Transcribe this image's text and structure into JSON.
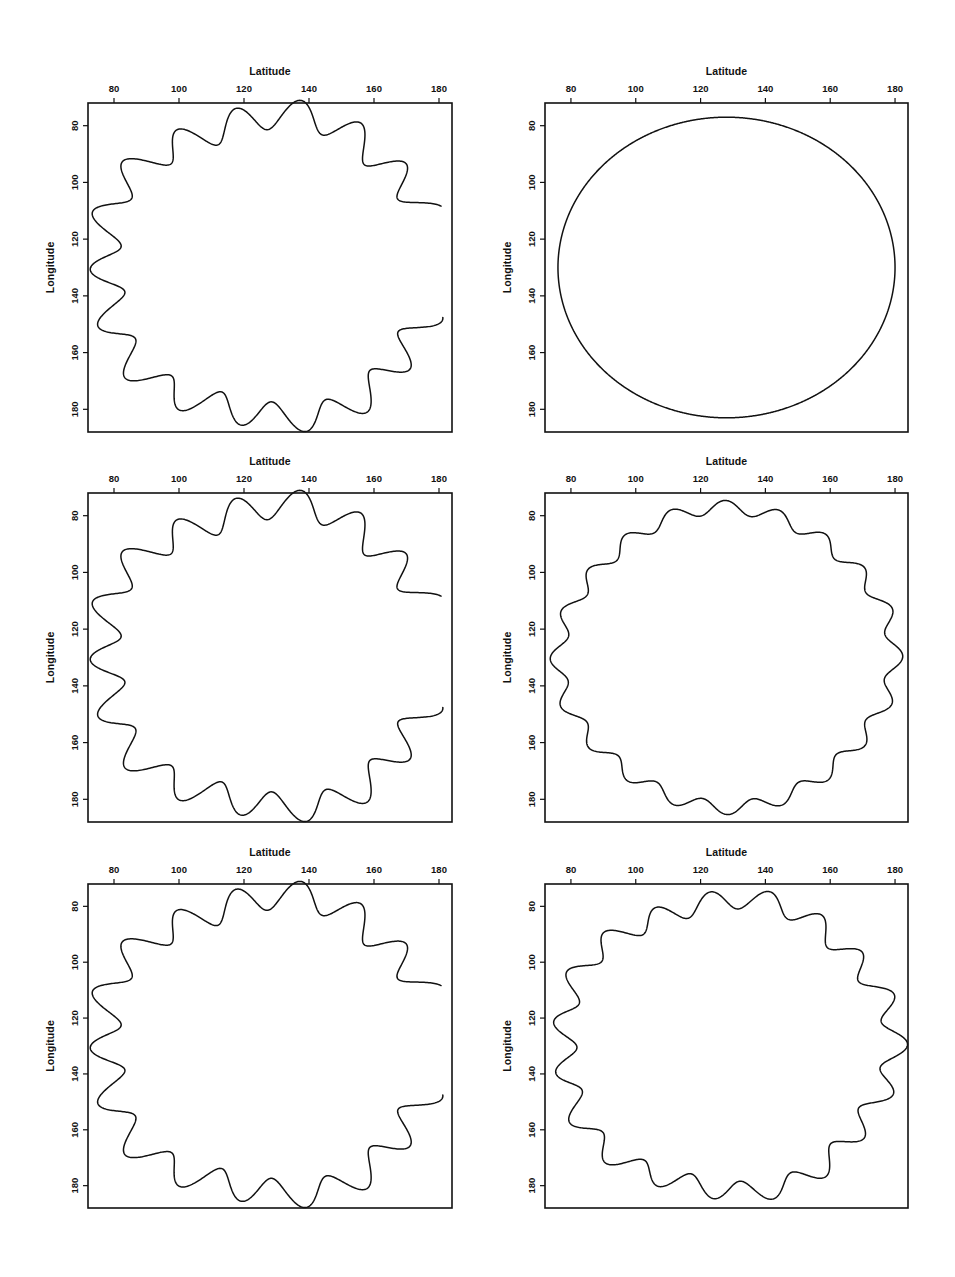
{
  "figure": {
    "background": "#ffffff",
    "line_color": "#111111",
    "panel_rows": 3,
    "panel_cols": 2
  },
  "axes": {
    "x_title": "Latitude",
    "y_title": "Longitude",
    "x_ticks": [
      80,
      100,
      120,
      140,
      160,
      180
    ],
    "y_ticks": [
      80,
      100,
      120,
      140,
      160,
      180
    ],
    "x_tick_labels": [
      "80",
      "100",
      "120",
      "140",
      "160",
      "180"
    ],
    "y_tick_labels": [
      "80",
      "100",
      "120",
      "140",
      "160",
      "180"
    ],
    "xlim": [
      72,
      184
    ],
    "ylim": [
      72,
      188
    ],
    "x_title_position": "top",
    "y_title_position": "left",
    "grid": false
  },
  "chart_data": {
    "type": "line",
    "title": "",
    "xlabel": "Latitude",
    "ylabel": "Longitude",
    "xlim": [
      72,
      184
    ],
    "ylim": [
      72,
      188
    ],
    "grid": false,
    "panels": [
      {
        "id": "panel-1",
        "row": 1,
        "col": 1,
        "series_name": "perturbed-contour-high-amplitude",
        "center": [
          128,
          130
        ],
        "radius_x": 52,
        "radius_y": 53,
        "wave_number": 18,
        "wave_amplitude": 5.0,
        "secondary_wave_number": 5,
        "secondary_wave_amplitude": 1.8,
        "phase_deg": 14,
        "open_gap": true,
        "gap_start_deg": -22,
        "gap_end_deg": 18,
        "closed": false
      },
      {
        "id": "panel-2",
        "row": 1,
        "col": 2,
        "series_name": "unperturbed-contour-smooth",
        "center": [
          128,
          130
        ],
        "radius_x": 52,
        "radius_y": 53,
        "wave_number": 0,
        "wave_amplitude": 0.0,
        "secondary_wave_number": 0,
        "secondary_wave_amplitude": 0.0,
        "phase_deg": 0,
        "open_gap": false,
        "gap_start_deg": 0,
        "gap_end_deg": 0,
        "closed": true
      },
      {
        "id": "panel-3",
        "row": 2,
        "col": 1,
        "series_name": "perturbed-contour-high-amplitude",
        "center": [
          128,
          130
        ],
        "radius_x": 52,
        "radius_y": 53,
        "wave_number": 18,
        "wave_amplitude": 5.0,
        "secondary_wave_number": 5,
        "secondary_wave_amplitude": 1.8,
        "phase_deg": 14,
        "open_gap": true,
        "gap_start_deg": -22,
        "gap_end_deg": 18,
        "closed": false
      },
      {
        "id": "panel-4",
        "row": 2,
        "col": 2,
        "series_name": "perturbed-contour-low-amplitude",
        "center": [
          128,
          130
        ],
        "radius_x": 51,
        "radius_y": 52,
        "wave_number": 20,
        "wave_amplitude": 2.4,
        "secondary_wave_number": 4,
        "secondary_wave_amplitude": 1.0,
        "phase_deg": 8,
        "open_gap": false,
        "gap_start_deg": 0,
        "gap_end_deg": 0,
        "closed": true
      },
      {
        "id": "panel-5",
        "row": 3,
        "col": 1,
        "series_name": "perturbed-contour-high-amplitude",
        "center": [
          128,
          130
        ],
        "radius_x": 52,
        "radius_y": 53,
        "wave_number": 18,
        "wave_amplitude": 5.0,
        "secondary_wave_number": 5,
        "secondary_wave_amplitude": 1.8,
        "phase_deg": 14,
        "open_gap": true,
        "gap_start_deg": -22,
        "gap_end_deg": 18,
        "closed": false
      },
      {
        "id": "panel-6",
        "row": 3,
        "col": 2,
        "series_name": "perturbed-contour-medium-amplitude",
        "center": [
          128,
          130
        ],
        "radius_x": 51,
        "radius_y": 52,
        "wave_number": 19,
        "wave_amplitude": 3.6,
        "secondary_wave_number": 5,
        "secondary_wave_amplitude": 1.3,
        "phase_deg": 10,
        "open_gap": false,
        "gap_start_deg": 0,
        "gap_end_deg": 0,
        "closed": true
      }
    ]
  },
  "panel_geometry": [
    {
      "id": "panel-1",
      "left": 88,
      "top": 103,
      "width": 364,
      "height": 329
    },
    {
      "id": "panel-2",
      "left": 545,
      "top": 103,
      "width": 363,
      "height": 329
    },
    {
      "id": "panel-3",
      "left": 88,
      "top": 493,
      "width": 364,
      "height": 329
    },
    {
      "id": "panel-4",
      "left": 545,
      "top": 493,
      "width": 363,
      "height": 329
    },
    {
      "id": "panel-5",
      "left": 88,
      "top": 884,
      "width": 364,
      "height": 324
    },
    {
      "id": "panel-6",
      "left": 545,
      "top": 884,
      "width": 363,
      "height": 324
    }
  ]
}
